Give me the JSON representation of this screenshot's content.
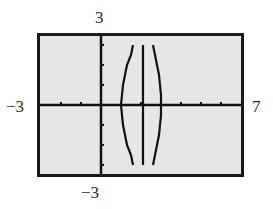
{
  "window": {
    "xmin": -3,
    "xmax": 7,
    "ymin": -3,
    "ymax": 3,
    "labels": {
      "top": "3",
      "bottom": "−3",
      "left": "−3",
      "right": "7"
    }
  },
  "colors": {
    "screen_bg": "#e6e6e6",
    "frame": "#1a1a1a",
    "ink": "#111111"
  },
  "chart_data": {
    "type": "line",
    "title": "",
    "xlabel": "",
    "ylabel": "",
    "xlim": [
      -3,
      7
    ],
    "ylim": [
      -3,
      3
    ],
    "grid": false,
    "legend": "none",
    "x_ticks": [
      -2,
      -1,
      0,
      1,
      2,
      3,
      4,
      5,
      6
    ],
    "y_ticks": [
      -3,
      -2,
      -1,
      1,
      2,
      3
    ],
    "tick_labels": {
      "xmin": "−3",
      "xmax": "7",
      "ymin": "−3",
      "ymax": "3"
    },
    "series": [
      {
        "name": "left branch",
        "points": [
          [
            1.6,
            3.0
          ],
          [
            1.5,
            2.5
          ],
          [
            1.3,
            2.0
          ],
          [
            1.2,
            1.5
          ],
          [
            1.1,
            1.0
          ],
          [
            1.05,
            0.5
          ],
          [
            1.0,
            0.0
          ],
          [
            1.05,
            -0.5
          ],
          [
            1.1,
            -1.0
          ],
          [
            1.2,
            -1.5
          ],
          [
            1.3,
            -2.0
          ],
          [
            1.5,
            -2.5
          ],
          [
            1.6,
            -3.0
          ]
        ]
      },
      {
        "name": "right branch",
        "points": [
          [
            2.6,
            3.0
          ],
          [
            2.7,
            2.5
          ],
          [
            2.8,
            2.0
          ],
          [
            2.9,
            1.5
          ],
          [
            2.95,
            1.0
          ],
          [
            3.0,
            0.5
          ],
          [
            3.0,
            0.0
          ],
          [
            3.0,
            -0.5
          ],
          [
            2.95,
            -1.0
          ],
          [
            2.9,
            -1.5
          ],
          [
            2.8,
            -2.0
          ],
          [
            2.7,
            -2.5
          ],
          [
            2.6,
            -3.0
          ]
        ]
      },
      {
        "name": "vertical asymptote",
        "points": [
          [
            2.1,
            3.0
          ],
          [
            2.1,
            -3.0
          ]
        ]
      }
    ]
  }
}
